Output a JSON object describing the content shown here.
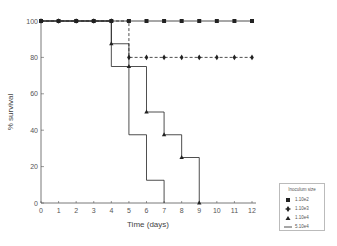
{
  "chart_data": {
    "type": "line",
    "subtype": "kaplan-meier step",
    "title": "",
    "xlabel": "Time (days)",
    "ylabel": "% survival",
    "xlim": [
      0,
      12
    ],
    "ylim": [
      0,
      100
    ],
    "xticks": [
      0,
      1,
      2,
      3,
      4,
      5,
      6,
      7,
      8,
      9,
      10,
      11,
      12
    ],
    "yticks": [
      0,
      20,
      40,
      60,
      80,
      100
    ],
    "grid": false,
    "legend_title": "Inoculum size",
    "legend_position": "lower right outside",
    "series": [
      {
        "name": "1.10e2",
        "marker": "square",
        "line": "solid",
        "x": [
          0,
          1,
          2,
          3,
          4,
          5,
          6,
          7,
          8,
          9,
          10,
          11,
          12
        ],
        "y": [
          100,
          100,
          100,
          100,
          100,
          100,
          100,
          100,
          100,
          100,
          100,
          100,
          100
        ]
      },
      {
        "name": "1.10e3",
        "marker": "diamond",
        "line": "dashed",
        "x": [
          0,
          1,
          2,
          3,
          4,
          5,
          6,
          7,
          8,
          9,
          10,
          11,
          12
        ],
        "y": [
          100,
          100,
          100,
          100,
          100,
          80,
          80,
          80,
          80,
          80,
          80,
          80,
          80
        ]
      },
      {
        "name": "1.10e4",
        "marker": "triangle",
        "line": "solid",
        "x": [
          0,
          4,
          5,
          6,
          7,
          8,
          9
        ],
        "y": [
          100,
          87.5,
          75,
          50,
          37.5,
          25,
          0
        ]
      },
      {
        "name": "5.10e4",
        "marker": "none",
        "line": "solid",
        "x": [
          0,
          4,
          5,
          6,
          7
        ],
        "y": [
          100,
          75,
          37.5,
          12.5,
          0
        ]
      }
    ]
  },
  "legend": {
    "title": "Inoculum size",
    "items": [
      {
        "label": "1.10e2",
        "symbol": "square"
      },
      {
        "label": "1.10e3",
        "symbol": "diamond"
      },
      {
        "label": "1.10e4",
        "symbol": "triangle"
      },
      {
        "label": "5.10e4",
        "symbol": "line"
      }
    ]
  },
  "colors": {
    "line": "#222222",
    "axis": "#555555"
  }
}
